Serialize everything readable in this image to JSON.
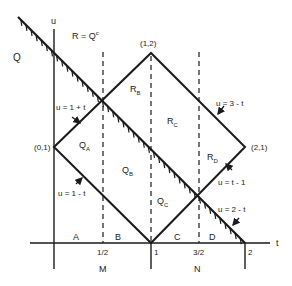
{
  "diagram": {
    "axes": {
      "t_label": "t",
      "u_label": "u",
      "t_ticks": [
        "1/2",
        "1",
        "3/2",
        "2"
      ],
      "interval_labels": [
        "M",
        "N"
      ],
      "segment_labels": [
        "A",
        "B",
        "C",
        "D"
      ]
    },
    "vertices": {
      "left": "(0,1)",
      "top": "(1,2)",
      "right": "(2,1)"
    },
    "lines": {
      "upper_left": "u = 1 + t",
      "lower_left": "u = 1 - t",
      "upper_right": "u = 3 - t",
      "lower_right": "u = t - 1",
      "hatched": "u = 2 - t"
    },
    "region_labels": {
      "Q": "Q",
      "R": "R = Q",
      "R_sup": "c",
      "QA": "Q",
      "QA_sub": "A",
      "QB": "Q",
      "QB_sub": "B",
      "QC": "Q",
      "QC_sub": "C",
      "RB": "R",
      "RB_sub": "B",
      "RC": "R",
      "RC_sub": "C",
      "RD": "R",
      "RD_sub": "D"
    },
    "colors": {
      "stroke": "#1a1a1a",
      "background": "#ffffff"
    }
  }
}
